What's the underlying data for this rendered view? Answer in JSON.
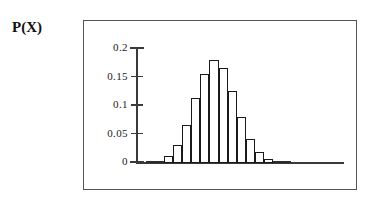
{
  "figure": {
    "axis_title": "P(X)",
    "frame_color": "#555555",
    "axis_color": "#3a3a3a",
    "bar_edge_color": "#1a1a1a",
    "bar_fill_color": "#ffffff"
  },
  "chart_data": {
    "type": "bar",
    "title": "",
    "subtitle": "",
    "xlabel": "",
    "ylabel": "P(X)",
    "grid": false,
    "legend": null,
    "ylim": [
      0,
      0.2
    ],
    "ytick_labels": [
      "0.2",
      "0.15",
      "0.1",
      "0.05",
      "0"
    ],
    "ytick_values": [
      0.2,
      0.15,
      0.1,
      0.05,
      0
    ],
    "xtick_labels": [],
    "categories": [
      "0",
      "1",
      "2",
      "3",
      "4",
      "5",
      "6",
      "7",
      "8",
      "9",
      "10",
      "11",
      "12",
      "13",
      "14",
      "15"
    ],
    "values": [
      0.003,
      0.003,
      0.012,
      0.031,
      0.067,
      0.114,
      0.157,
      0.18,
      0.167,
      0.127,
      0.08,
      0.043,
      0.019,
      0.007,
      0.003,
      0.002
    ],
    "annotations": []
  }
}
